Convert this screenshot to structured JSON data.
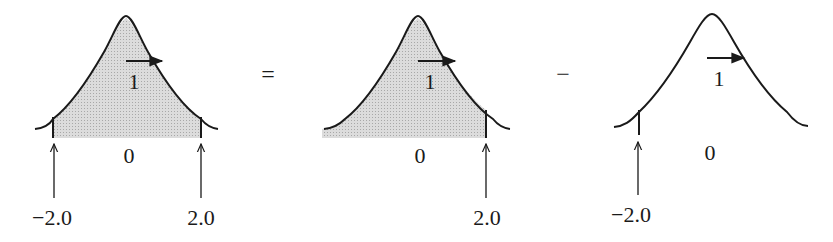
{
  "operators": {
    "equals": "=",
    "minus": "−"
  },
  "panels": [
    {
      "id": "total",
      "shaded": "between",
      "center_label": "0",
      "arrow_label": "1",
      "bound_labels": [
        "−2.0",
        "2.0"
      ]
    },
    {
      "id": "upper",
      "shaded": "left-of-upper",
      "center_label": "0",
      "arrow_label": "1",
      "bound_labels": [
        "2.0"
      ]
    },
    {
      "id": "lower",
      "shaded": "none",
      "center_label": "0",
      "arrow_label": "1",
      "bound_labels": [
        "−2.0"
      ]
    }
  ],
  "colors": {
    "ink": "#1a1a1a",
    "shade": "#d6d6d6"
  }
}
